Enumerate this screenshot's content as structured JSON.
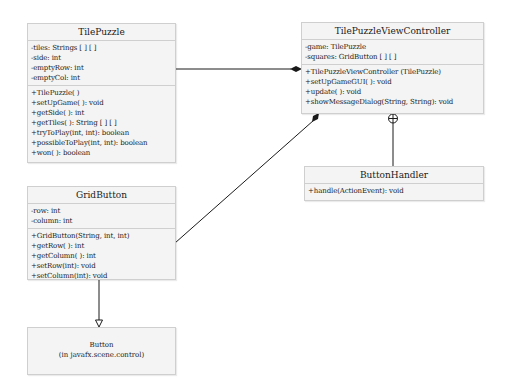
{
  "diagram": {
    "type": "UML class diagram",
    "classes": {
      "tile_puzzle": {
        "name": "TilePuzzle",
        "attributes": [
          "-tiles: Strings [ ] [ ]",
          "-side: int",
          "-emptyRow: int",
          "-emptyCol: int"
        ],
        "methods": [
          "+TilePuzzle( )",
          "+setUpGame( ): void",
          "+getSide( ): int",
          "+getTiles( ): String [ ] [ ]",
          "+tryToPlay(int, int): boolean",
          "+possibleToPlay(int, int): boolean",
          "+won( ): boolean"
        ]
      },
      "view_controller": {
        "name": "TilePuzzleViewController",
        "attributes": [
          "-game: TilePuzzle",
          "-squares: GridButton [ ] [ ]"
        ],
        "methods": [
          "+TilePuzzleViewController (TilePuzzle)",
          "+setUpGameGUI( ): void",
          "+update( ): void",
          "+showMessageDialog(String, String): void"
        ]
      },
      "button_handler": {
        "name": "ButtonHandler",
        "methods": [
          "+handle(ActionEvent): void"
        ]
      },
      "grid_button": {
        "name": "GridButton",
        "attributes": [
          "-row: int",
          "-column: int"
        ],
        "methods": [
          "+GridButton(String, int, int)",
          "+getRow( ): int",
          "+getColumn( ): int",
          "+setRow(int): void",
          "+setColumn(int): void"
        ]
      },
      "button": {
        "name": "Button",
        "package": "(in javafx.scene.control)"
      }
    },
    "relationships": [
      {
        "from": "TilePuzzleViewController",
        "to": "TilePuzzle",
        "kind": "composition"
      },
      {
        "from": "TilePuzzleViewController",
        "to": "GridButton",
        "kind": "composition"
      },
      {
        "from": "TilePuzzleViewController",
        "to": "ButtonHandler",
        "kind": "nested-class"
      },
      {
        "from": "GridButton",
        "to": "Button",
        "kind": "generalization"
      }
    ],
    "colors": {
      "box_fill": "#f4f4f4",
      "box_border": "#cfcfcf",
      "line": "#1a1a1a"
    }
  }
}
